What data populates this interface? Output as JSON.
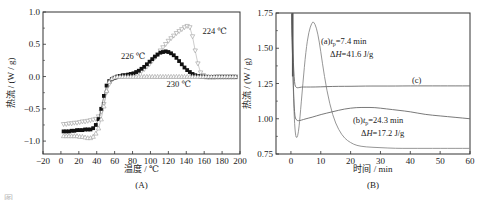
{
  "figure": {
    "caption_partial": "图"
  },
  "chart_data": [
    {
      "type": "scatter",
      "panel_label": "(A)",
      "title": "",
      "xlabel": "温度 / ℃",
      "ylabel": "热流 / (W / g)",
      "xlim": [
        -20,
        200
      ],
      "ylim": [
        -1.2,
        1.0
      ],
      "xticks": [
        -20,
        0,
        20,
        40,
        60,
        80,
        100,
        120,
        140,
        160,
        180,
        200
      ],
      "yticks": [
        1.0,
        0.5,
        0.0,
        -0.5,
        -1.0
      ],
      "ytick_labels": [
        "1.0",
        "0.5",
        "0.0",
        "−0.5",
        "−1.0"
      ],
      "xtick_labels": [
        "−20",
        "0",
        "20",
        "40",
        "60",
        "80",
        "100",
        "120",
        "140",
        "160",
        "180",
        "200"
      ],
      "grid": false,
      "annotations": [
        {
          "text": "224 ℃",
          "x": 158,
          "y": 0.66
        },
        {
          "text": "226 ℃",
          "x": 67,
          "y": 0.27
        },
        {
          "text": "230 ℃",
          "x": 118,
          "y": -0.16
        }
      ],
      "series": [
        {
          "name": "224 ℃",
          "marker": "triangle-down-open",
          "color": "#9a9a9a",
          "x": [
            3,
            6,
            9,
            12,
            15,
            18,
            21,
            24,
            27,
            30,
            33,
            36,
            39,
            42,
            45,
            48,
            51,
            54,
            57,
            60,
            63,
            66,
            69,
            72,
            75,
            78,
            81,
            84,
            87,
            90,
            93,
            96,
            99,
            102,
            105,
            108,
            111,
            114,
            117,
            120,
            123,
            126,
            129,
            132,
            135,
            138,
            141,
            144,
            147,
            150,
            153,
            156,
            159,
            162,
            165,
            168,
            171,
            174,
            177,
            180,
            183,
            186,
            189,
            192,
            195
          ],
          "y": [
            -0.74,
            -0.74,
            -0.73,
            -0.73,
            -0.72,
            -0.72,
            -0.71,
            -0.7,
            -0.7,
            -0.69,
            -0.68,
            -0.67,
            -0.66,
            -0.62,
            -0.55,
            -0.43,
            -0.25,
            -0.12,
            -0.05,
            -0.02,
            -0.01,
            0.0,
            0.0,
            0.01,
            0.02,
            0.02,
            0.03,
            0.04,
            0.06,
            0.08,
            0.11,
            0.15,
            0.19,
            0.24,
            0.29,
            0.34,
            0.4,
            0.45,
            0.5,
            0.55,
            0.59,
            0.63,
            0.67,
            0.7,
            0.73,
            0.76,
            0.78,
            0.76,
            0.62,
            0.4,
            0.2,
            0.06,
            0.02,
            0.0,
            -0.01,
            -0.01,
            -0.01,
            0.0,
            0.0,
            0.0,
            0.0,
            0.0,
            0.0,
            0.0,
            0.0
          ]
        },
        {
          "name": "226 ℃",
          "marker": "square-filled",
          "color": "#111111",
          "x": [
            3,
            6,
            9,
            12,
            15,
            18,
            21,
            24,
            27,
            30,
            33,
            36,
            39,
            42,
            45,
            48,
            51,
            54,
            57,
            60,
            63,
            66,
            69,
            72,
            75,
            78,
            81,
            84,
            87,
            90,
            93,
            96,
            99,
            102,
            105,
            108,
            111,
            114,
            117,
            120,
            123,
            126,
            129,
            132,
            135,
            138,
            141,
            144,
            147,
            150,
            153,
            156,
            159,
            162,
            165,
            168,
            171,
            174,
            177,
            180,
            183,
            186,
            189,
            192,
            195
          ],
          "y": [
            -0.85,
            -0.85,
            -0.85,
            -0.84,
            -0.84,
            -0.83,
            -0.83,
            -0.83,
            -0.82,
            -0.82,
            -0.82,
            -0.8,
            -0.75,
            -0.66,
            -0.5,
            -0.3,
            -0.14,
            -0.07,
            -0.04,
            -0.02,
            0.0,
            0.01,
            0.02,
            0.02,
            0.03,
            0.04,
            0.05,
            0.07,
            0.09,
            0.12,
            0.15,
            0.19,
            0.23,
            0.27,
            0.31,
            0.34,
            0.37,
            0.38,
            0.39,
            0.38,
            0.36,
            0.33,
            0.29,
            0.24,
            0.19,
            0.14,
            0.1,
            0.07,
            0.04,
            0.02,
            0.01,
            0.0,
            0.0,
            -0.01,
            -0.01,
            -0.01,
            -0.01,
            -0.01,
            -0.01,
            -0.01,
            -0.01,
            -0.01,
            -0.01,
            -0.01,
            -0.01
          ]
        },
        {
          "name": "230 ℃",
          "marker": "triangle-up-open",
          "color": "#9a9a9a",
          "x": [
            3,
            6,
            9,
            12,
            15,
            18,
            21,
            24,
            27,
            30,
            33,
            36,
            39,
            42,
            45,
            48,
            51,
            54,
            57,
            60,
            63,
            66,
            69,
            72,
            75,
            78,
            81,
            84,
            87,
            90,
            93,
            96,
            99,
            102,
            105,
            108,
            111,
            114,
            117,
            120,
            123,
            126,
            129,
            132,
            135,
            138,
            141,
            144,
            147,
            150,
            153,
            156,
            159,
            162,
            165,
            168,
            171,
            174,
            177,
            180,
            183,
            186,
            189,
            192,
            195
          ],
          "y": [
            -0.92,
            -0.92,
            -0.92,
            -0.92,
            -0.92,
            -0.92,
            -0.93,
            -0.93,
            -0.94,
            -0.95,
            -0.95,
            -0.93,
            -0.88,
            -0.8,
            -0.66,
            -0.46,
            -0.22,
            -0.08,
            -0.03,
            -0.01,
            0.0,
            0.0,
            0.0,
            0.0,
            0.0,
            0.0,
            0.0,
            0.0,
            0.0,
            0.0,
            0.0,
            0.0,
            0.0,
            0.0,
            0.0,
            0.0,
            0.0,
            0.0,
            0.0,
            0.0,
            0.0,
            0.0,
            0.0,
            0.0,
            0.0,
            0.0,
            0.0,
            0.0,
            0.0,
            0.0,
            0.0,
            0.0,
            0.0,
            0.0,
            0.0,
            0.0,
            0.0,
            0.0,
            0.0,
            0.0,
            0.0,
            0.0,
            0.0,
            0.0,
            0.0
          ]
        }
      ]
    },
    {
      "type": "line",
      "panel_label": "(B)",
      "title": "",
      "xlabel": "时间 / min",
      "ylabel": "热流 / (W / g)",
      "xlim": [
        -5,
        60
      ],
      "ylim": [
        0.75,
        1.75
      ],
      "xticks": [
        0,
        10,
        20,
        30,
        40,
        50,
        60
      ],
      "xtick_labels": [
        "0",
        "10",
        "20",
        "30",
        "40",
        "50",
        "60"
      ],
      "yticks": [
        0.75,
        1.0,
        1.25,
        1.5,
        1.75
      ],
      "ytick_labels": [
        "0.75",
        "1.00",
        "1.25",
        "1.50",
        "1.75"
      ],
      "grid": false,
      "annotations": [
        {
          "label": "(a)",
          "text_line1": "(a)t_p = 7.4 min",
          "text_line2": "ΔH = 41.6 J/g",
          "tp": 7.4,
          "tp_unit": "min",
          "deltaH": 41.6,
          "deltaH_unit": "J/g"
        },
        {
          "label": "(b)",
          "text_line1": "(b)t_p = 24.3 min",
          "text_line2": "ΔH = 17.2 J/g",
          "tp": 24.3,
          "tp_unit": "min",
          "deltaH": 17.2,
          "deltaH_unit": "J/g"
        },
        {
          "label": "(c)",
          "text": "(c)"
        }
      ],
      "series": [
        {
          "name": "(a)",
          "color": "#8a8a8a",
          "x": [
            0.2,
            0.6,
            1.0,
            1.5,
            2.0,
            2.5,
            3.0,
            4.0,
            5.0,
            6.0,
            7.0,
            7.6,
            8.5,
            9.5,
            10.5,
            12,
            14,
            16,
            18,
            20,
            22,
            25,
            30,
            35,
            40,
            45,
            50,
            55,
            60
          ],
          "y": [
            1.75,
            1.4,
            1.05,
            0.88,
            0.86,
            0.9,
            1.0,
            1.25,
            1.48,
            1.62,
            1.68,
            1.69,
            1.65,
            1.55,
            1.4,
            1.2,
            1.02,
            0.92,
            0.86,
            0.83,
            0.81,
            0.8,
            0.795,
            0.79,
            0.79,
            0.79,
            0.79,
            0.79,
            0.79
          ]
        },
        {
          "name": "(b)",
          "color": "#6a6a6a",
          "x": [
            0.2,
            0.7,
            1.2,
            1.8,
            2.5,
            3.5,
            5,
            7,
            10,
            14,
            18,
            22,
            25,
            28,
            32,
            36,
            40,
            45,
            50,
            55,
            60
          ],
          "y": [
            1.75,
            1.3,
            1.02,
            0.99,
            0.985,
            0.99,
            1.0,
            1.01,
            1.03,
            1.05,
            1.07,
            1.08,
            1.08,
            1.08,
            1.07,
            1.06,
            1.05,
            1.03,
            1.02,
            1.01,
            1.0
          ]
        },
        {
          "name": "(c)",
          "color": "#6a6a6a",
          "x": [
            0.2,
            0.7,
            1.2,
            1.8,
            2.5,
            3.5,
            5,
            8,
            12,
            16,
            20,
            25,
            30,
            35,
            40,
            45,
            50,
            55,
            60
          ],
          "y": [
            1.75,
            1.45,
            1.24,
            1.22,
            1.22,
            1.225,
            1.225,
            1.225,
            1.228,
            1.23,
            1.23,
            1.232,
            1.232,
            1.232,
            1.233,
            1.233,
            1.233,
            1.233,
            1.233
          ]
        }
      ]
    }
  ]
}
